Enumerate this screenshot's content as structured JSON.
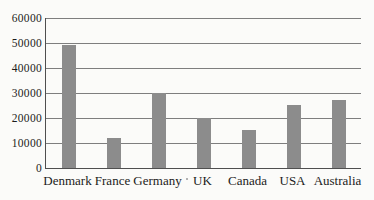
{
  "chart_data": {
    "type": "bar",
    "title": "",
    "xlabel": "",
    "ylabel": "",
    "categories": [
      "Denmark",
      "France",
      "Germany",
      "UK",
      "Canada",
      "USA",
      "Australia"
    ],
    "values": [
      49000,
      12000,
      30000,
      20000,
      15000,
      25000,
      27000
    ],
    "ylim": [
      0,
      60000
    ],
    "ytick_interval": 10000,
    "yticks": [
      "0",
      "10000",
      "20000",
      "30000",
      "40000",
      "50000",
      "60000"
    ],
    "grid": true,
    "legend": false,
    "colors": {
      "bar": "#8c8c8c",
      "axis": "#4f4f4f",
      "gridline": "#7e7e7e",
      "text": "#1b1b1b",
      "background": "#fbfbf9"
    }
  }
}
